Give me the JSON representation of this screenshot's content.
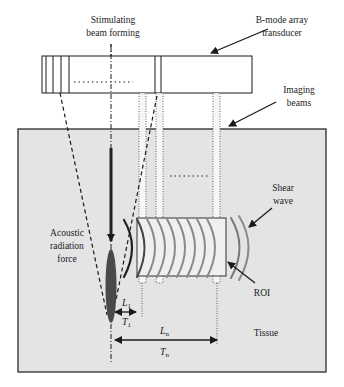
{
  "labels": {
    "stimulating_line1": "Stimulating",
    "stimulating_line2": "beam forming",
    "transducer_line1": "B-mode array",
    "transducer_line2": "transducer",
    "imaging_line1": "Imaging",
    "imaging_line2": "beams",
    "shear_line1": "Shear",
    "shear_line2": "wave",
    "arf_line1": "Acoustic",
    "arf_line2": "radiation",
    "arf_line3": "force",
    "roi": "ROI",
    "tissue": "Tissue",
    "l1_main": "L",
    "l1_sub": "1",
    "t1_main": "T",
    "t1_sub": "1",
    "ln_main": "L",
    "ln_sub": "n",
    "tn_main": "T",
    "tn_sub": "n",
    "ellipsis_transducer": "...........",
    "ellipsis_beams": "........"
  },
  "colors": {
    "tissue_fill": "#e4e4e4",
    "line": "#1a1a1a",
    "focus_fill": "#555555",
    "wave_dark": "#222222",
    "wave_gray": "#8a8a8a",
    "roi_fill": "#efefef"
  }
}
